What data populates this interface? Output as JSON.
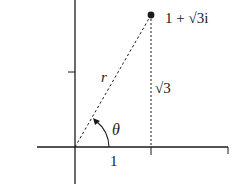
{
  "diagram": {
    "point_label": "1 + √3i",
    "radius_label": "r",
    "angle_label": "θ",
    "height_label": "√3",
    "base_label": "1",
    "point": {
      "re": 1,
      "im": 1.7320508
    },
    "colors": {
      "ink": "#1a1a1a",
      "background": "#ffffff"
    }
  }
}
